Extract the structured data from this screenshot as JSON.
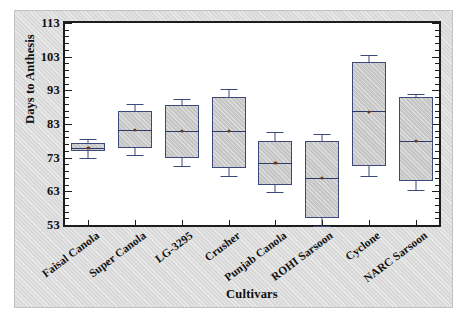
{
  "chart_data": {
    "type": "box",
    "title": "",
    "xlabel": "Cultivars",
    "ylabel": "Days to Anthesis",
    "ylim": [
      53,
      113
    ],
    "ytick_labels": [
      "113",
      "103",
      "93",
      "83",
      "73",
      "63",
      "53"
    ],
    "ytick_values": [
      113,
      103,
      93,
      83,
      73,
      63,
      53
    ],
    "ytick_minor_step": 2,
    "grid": false,
    "legend": null,
    "categories": [
      "Faisal Canola",
      "Super Canola",
      "LG-3295",
      "Crusher",
      "Punjab Canola",
      "ROHI Sarsoon",
      "Cyclone",
      "NARC Sarsoon"
    ],
    "boxes": [
      {
        "category": "Faisal Canola",
        "whisker_low": 73.0,
        "q1": 75.0,
        "median": 75.8,
        "q3": 77.5,
        "whisker_high": 78.6,
        "mean": 75.9
      },
      {
        "category": "Super Canola",
        "whisker_low": 73.7,
        "q1": 76.0,
        "median": 81.3,
        "q3": 87.0,
        "whisker_high": 89.0,
        "mean": 81.3
      },
      {
        "category": "LG-3295",
        "whisker_low": 70.5,
        "q1": 72.8,
        "median": 81.0,
        "q3": 88.5,
        "whisker_high": 90.5,
        "mean": 81.0
      },
      {
        "category": "Crusher",
        "whisker_low": 67.5,
        "q1": 70.0,
        "median": 81.0,
        "q3": 91.0,
        "whisker_high": 93.5,
        "mean": 81.0
      },
      {
        "category": "Punjab Canola",
        "whisker_low": 62.8,
        "q1": 65.0,
        "median": 71.5,
        "q3": 78.0,
        "whisker_high": 80.5,
        "mean": 71.5
      },
      {
        "category": "ROHI Sarsoon",
        "whisker_low": 52.8,
        "q1": 55.0,
        "median": 67.0,
        "q3": 78.0,
        "whisker_high": 80.0,
        "mean": 67.0
      },
      {
        "category": "Cyclone",
        "whisker_low": 67.5,
        "q1": 70.5,
        "median": 87.0,
        "q3": 101.5,
        "whisker_high": 103.5,
        "mean": 86.5
      },
      {
        "category": "NARC Sarsoon",
        "whisker_low": 63.3,
        "q1": 66.0,
        "median": 78.0,
        "q3": 91.0,
        "whisker_high": 92.0,
        "mean": 78.0
      }
    ]
  },
  "style": {
    "figure_background": "#d9d9d9",
    "plot_background": "#ffffff",
    "frame_color": "#1d1d1d",
    "box_fill": "#c6c6c6",
    "box_edge": "#3b4a7a",
    "median_color": "#2c3a68",
    "mean_marker_color": "#6b3a14",
    "text_color": "#0f0f0f"
  }
}
